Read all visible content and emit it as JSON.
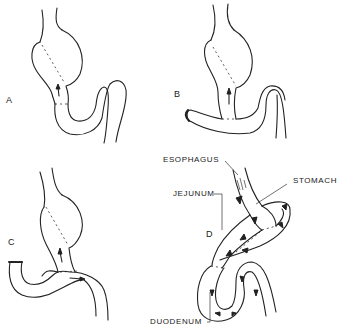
{
  "figure": {
    "panels": [
      {
        "id": "A",
        "label": "A"
      },
      {
        "id": "B",
        "label": "B"
      },
      {
        "id": "C",
        "label": "C"
      },
      {
        "id": "D",
        "label": "D"
      }
    ],
    "annotations": {
      "esophagus": "ESOPHAGUS",
      "stomach": "STOMACH",
      "jejunum": "JEJUNUM",
      "duodenum": "DUODENUM"
    },
    "colors": {
      "line": "#222222",
      "background": "#ffffff"
    }
  }
}
